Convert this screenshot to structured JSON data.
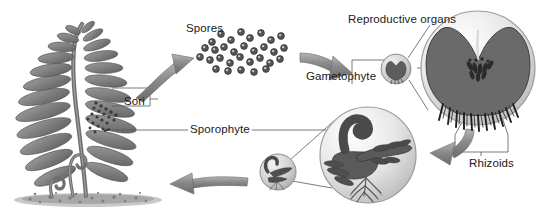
{
  "figure": {
    "type": "biology-life-cycle-diagram",
    "background_color": "#ffffff",
    "ink_color": "#1a1a1a",
    "fill_dark": "#6e6e6e",
    "fill_mid": "#9a9a9a",
    "fill_light": "#d7d7d7"
  },
  "labels": {
    "spores": "Spores",
    "sori": "Sori",
    "reproductive_organs": "Reproductive organs",
    "gametophyte": "Gametophyte",
    "rhizoids": "Rhizoids",
    "sporophyte": "Sporophyte"
  },
  "stages": [
    {
      "id": "adult-sporophyte",
      "label": "Sporophyte",
      "description": "Mature fern frond with fiddleheads growing from soil",
      "position": {
        "x": 75,
        "y": 110
      }
    },
    {
      "id": "spore-cloud",
      "label": "Spores",
      "description": "Scattered released spores",
      "count": 31,
      "position": {
        "x": 248,
        "y": 52
      }
    },
    {
      "id": "gametophyte-small",
      "label": "Gametophyte",
      "description": "Small heart-shaped prothallus",
      "position": {
        "x": 396,
        "y": 69
      },
      "radius": 15
    },
    {
      "id": "gametophyte-magnified",
      "label": "Gametophyte magnified",
      "description": "Magnified prothallus showing reproductive organs and rhizoids",
      "position": {
        "x": 478,
        "y": 68
      },
      "radius": 57
    },
    {
      "id": "young-sporophyte-magnified",
      "label": "Young sporophyte magnified",
      "description": "Magnified young sporophyte emerging from gametophyte with roots",
      "position": {
        "x": 368,
        "y": 155
      },
      "radius": 48
    },
    {
      "id": "young-sporophyte-small",
      "label": "Young sporophyte",
      "description": "Small young sporophyte",
      "position": {
        "x": 278,
        "y": 172
      },
      "radius": 18
    }
  ],
  "arrows": [
    {
      "id": "arrow-sporophyte-to-spores",
      "from": "adult-sporophyte",
      "to": "spore-cloud",
      "direction": "right-up"
    },
    {
      "id": "arrow-spores-to-gametophyte",
      "from": "spore-cloud",
      "to": "gametophyte-small",
      "direction": "right-down"
    },
    {
      "id": "arrow-gametophyte-to-sporophyte",
      "from": "gametophyte-magnified",
      "to": "young-sporophyte-magnified",
      "direction": "left-down"
    },
    {
      "id": "arrow-young-to-adult",
      "from": "young-sporophyte-small",
      "to": "adult-sporophyte",
      "direction": "left"
    }
  ],
  "spore_dots": [
    [
      212,
      42
    ],
    [
      221,
      34
    ],
    [
      231,
      40
    ],
    [
      241,
      32
    ],
    [
      250,
      38
    ],
    [
      261,
      33
    ],
    [
      271,
      40
    ],
    [
      281,
      36
    ],
    [
      205,
      48
    ],
    [
      215,
      50
    ],
    [
      224,
      47
    ],
    [
      234,
      52
    ],
    [
      244,
      46
    ],
    [
      254,
      51
    ],
    [
      264,
      47
    ],
    [
      274,
      52
    ],
    [
      284,
      48
    ],
    [
      200,
      57
    ],
    [
      210,
      60
    ],
    [
      220,
      58
    ],
    [
      230,
      63
    ],
    [
      240,
      57
    ],
    [
      250,
      62
    ],
    [
      260,
      58
    ],
    [
      270,
      63
    ],
    [
      280,
      59
    ],
    [
      216,
      69
    ],
    [
      228,
      71
    ],
    [
      241,
      70
    ],
    [
      254,
      72
    ],
    [
      266,
      69
    ]
  ]
}
